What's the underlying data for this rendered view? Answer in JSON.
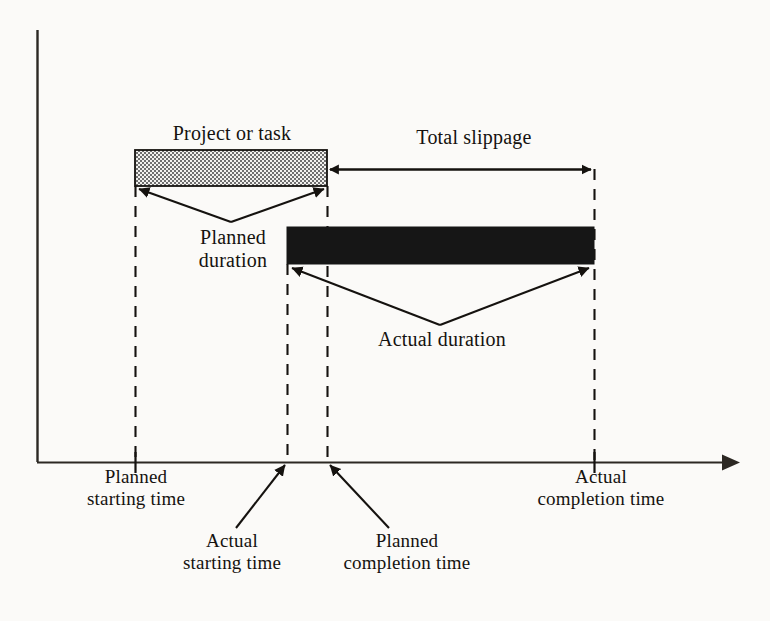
{
  "figure": {
    "kind": "schedule-slippage-diagram",
    "background_color": "#fbfaf8",
    "ink_color": "#15120f",
    "axis": {
      "y_axis_top_y": 30,
      "origin_x": 37,
      "origin_y": 462,
      "x_axis_end_x": 735,
      "has_x_arrowhead": true
    }
  },
  "bars": {
    "planned": {
      "label": "Project or task",
      "fill": "checkerboard-hatch",
      "fill_color": "#8a8a8a",
      "x1": 135,
      "x2": 327,
      "y1": 150,
      "y2": 186
    },
    "actual": {
      "fill": "solid",
      "fill_color": "#161616",
      "x1": 287,
      "x2": 594,
      "y1": 227,
      "y2": 264
    }
  },
  "annotations": {
    "project_or_task": "Project or task",
    "total_slippage": "Total slippage",
    "planned_duration": "Planned\nduration",
    "actual_duration": "Actual duration",
    "planned_starting_time": "Planned\nstarting time",
    "actual_starting_time": "Actual\nstarting time",
    "planned_completion_time": "Planned\ncompletion time",
    "actual_completion_time": "Actual\ncompletion time"
  },
  "time_markers": [
    {
      "name": "planned-starting-time",
      "x": 135,
      "marker": "axis-tick",
      "dashed_guide": true
    },
    {
      "name": "actual-starting-time",
      "x": 287,
      "marker": "pointer-arrow",
      "dashed_guide": true
    },
    {
      "name": "planned-completion-time",
      "x": 327,
      "marker": "pointer-arrow",
      "dashed_guide": true
    },
    {
      "name": "actual-completion-time",
      "x": 594,
      "marker": "axis-tick",
      "dashed_guide": true
    }
  ],
  "slippage_arrow": {
    "x1": 327,
    "x2": 585,
    "y": 169,
    "double_headed": true
  },
  "bleed_text": "the decisions taken   a project on   over the course of   the project   been call   if its charge   planned   cost"
}
